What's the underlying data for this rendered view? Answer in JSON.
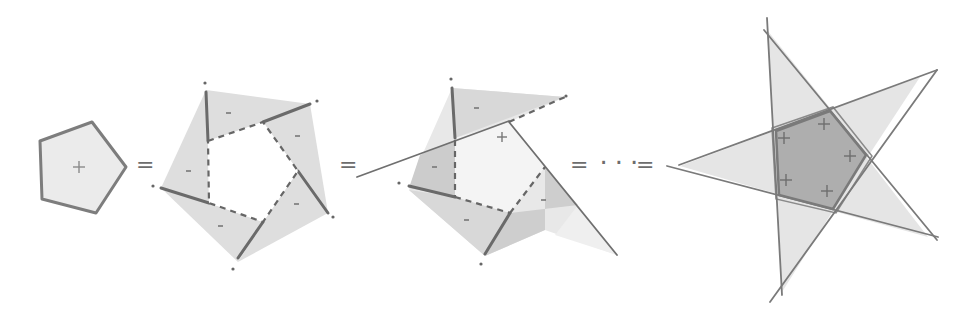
{
  "diagram": {
    "colors": {
      "stroke": "#7a7a7a",
      "fill_light": "#e6e6e6",
      "fill_mid": "#d4d4d4",
      "fill_dark": "#b8b8b8",
      "dashed": "#666666",
      "text": "#707070"
    },
    "panels": [
      {
        "id": "pentagon",
        "sign_labels": [
          "+"
        ]
      },
      {
        "id": "exploded",
        "sign_labels": [
          "-",
          "-",
          "-",
          "-",
          "-"
        ]
      },
      {
        "id": "partial",
        "sign_labels": [
          "+",
          "-",
          "-",
          "-",
          "-"
        ]
      },
      {
        "id": "star",
        "sign_labels": [
          "+",
          "+",
          "+",
          "+",
          "+"
        ]
      }
    ],
    "operators": {
      "eq1": "=",
      "eq2": "=",
      "eq3": "=",
      "ellipsis": "···",
      "eq4": "="
    }
  }
}
